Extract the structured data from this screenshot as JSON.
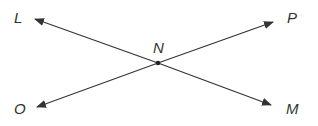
{
  "diagram": {
    "type": "intersecting-lines",
    "stroke_color": "#333333",
    "intersection": {
      "label": "N",
      "x": 158,
      "y": 63
    },
    "lines": [
      {
        "name": "line-LM",
        "from": "L",
        "to": "M"
      },
      {
        "name": "line-OP",
        "from": "O",
        "to": "P"
      }
    ],
    "rays": [
      {
        "label": "L",
        "tip": [
          35,
          19
        ],
        "label_pos": [
          14,
          10
        ]
      },
      {
        "label": "P",
        "tip": [
          273,
          22
        ],
        "label_pos": [
          287,
          10
        ]
      },
      {
        "label": "O",
        "tip": [
          37,
          107
        ],
        "label_pos": [
          14,
          101
        ]
      },
      {
        "label": "M",
        "tip": [
          271,
          105
        ],
        "label_pos": [
          286,
          101
        ]
      }
    ],
    "labels": {
      "L": "L",
      "P": "P",
      "O": "O",
      "M": "M",
      "N": "N"
    }
  }
}
